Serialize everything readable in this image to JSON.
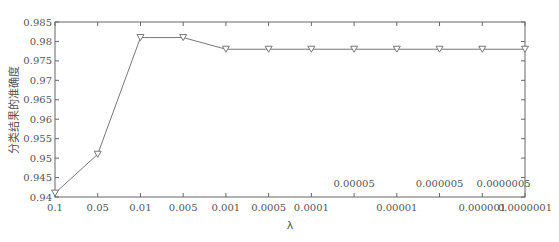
{
  "chart_data": {
    "type": "line",
    "title": "",
    "xlabel": "λ",
    "ylabel": "分类结果的准确度",
    "categories": [
      "0.1",
      "0.05",
      "0.01",
      "0.005",
      "0.001",
      "0.0005",
      "0.0001",
      "0.00005",
      "0.00001",
      "0.000005",
      "0.000001",
      "0.0000001"
    ],
    "x_tick_labels_bottom": [
      "0.1",
      "0.05",
      "0.01",
      "0.005",
      "0.001",
      "0.0005",
      "0.0001",
      "",
      "0.00001",
      "",
      "0.000001",
      "0.0000001"
    ],
    "x_tick_labels_inside": [
      {
        "index": 7,
        "label": "0.00005"
      },
      {
        "index": 9,
        "label": "0.000005"
      },
      {
        "index": 10.5,
        "label": "0.0000005"
      }
    ],
    "series": [
      {
        "name": "accuracy",
        "marker": "triangle-down",
        "color": "#777777",
        "values": [
          0.941,
          0.951,
          0.981,
          0.981,
          0.978,
          0.978,
          0.978,
          0.978,
          0.978,
          0.978,
          0.978,
          0.978
        ]
      }
    ],
    "ylim": [
      0.94,
      0.985
    ],
    "yticks": [
      0.94,
      0.945,
      0.95,
      0.955,
      0.96,
      0.965,
      0.97,
      0.975,
      0.98,
      0.985
    ],
    "ytick_labels": [
      "0.94",
      "0.945",
      "0.95",
      "0.955",
      "0.96",
      "0.965",
      "0.97",
      "0.975",
      "0.98",
      "0.985"
    ],
    "grid": false,
    "legend": "none"
  }
}
